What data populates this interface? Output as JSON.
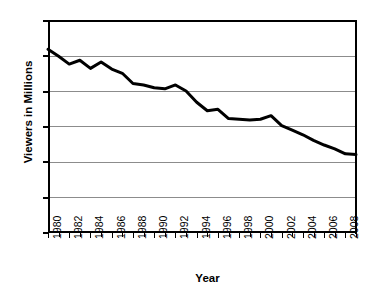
{
  "chart_data": {
    "type": "line",
    "title": "",
    "xlabel": "Year",
    "ylabel": "Viewers in Millions",
    "xlim": [
      1980,
      2009
    ],
    "ylim": [
      0,
      60
    ],
    "grid": true,
    "legend": "none",
    "y_ticks": [
      0,
      10,
      20,
      30,
      40,
      50,
      60
    ],
    "y_tick_labels": [
      "0",
      "10",
      "20",
      "30",
      "40",
      "50",
      "60"
    ],
    "x_ticks": [
      1980,
      1981,
      1982,
      1983,
      1984,
      1985,
      1986,
      1987,
      1988,
      1989,
      1990,
      1991,
      1992,
      1993,
      1994,
      1995,
      1996,
      1997,
      1998,
      1999,
      2000,
      2001,
      2002,
      2003,
      2004,
      2005,
      2006,
      2007,
      2008,
      2009
    ],
    "x_tick_labels": [
      "1980",
      "1982",
      "1984",
      "1986",
      "1988",
      "1990",
      "1992",
      "1994",
      "1996",
      "1998",
      "2000",
      "2002",
      "2004",
      "2006",
      "2008"
    ],
    "x_labeled_ticks": [
      1980,
      1982,
      1984,
      1986,
      1988,
      1990,
      1992,
      1994,
      1996,
      1998,
      2000,
      2002,
      2004,
      2006,
      2008
    ],
    "line_color": "#000000",
    "line_width": 3,
    "x": [
      1980,
      1981,
      1982,
      1983,
      1984,
      1985,
      1986,
      1987,
      1988,
      1989,
      1990,
      1991,
      1992,
      1993,
      1994,
      1995,
      1996,
      1997,
      1998,
      1999,
      2000,
      2001,
      2002,
      2003,
      2004,
      2005,
      2006,
      2007,
      2008,
      2009
    ],
    "values": [
      52.0,
      50.0,
      47.8,
      48.9,
      46.6,
      48.4,
      46.4,
      45.2,
      42.3,
      41.9,
      41.1,
      40.8,
      41.9,
      40.2,
      37.0,
      34.6,
      35.0,
      32.4,
      32.2,
      32.0,
      32.2,
      33.2,
      30.4,
      29.1,
      27.8,
      26.2,
      24.9,
      23.8,
      22.4,
      22.2
    ]
  }
}
